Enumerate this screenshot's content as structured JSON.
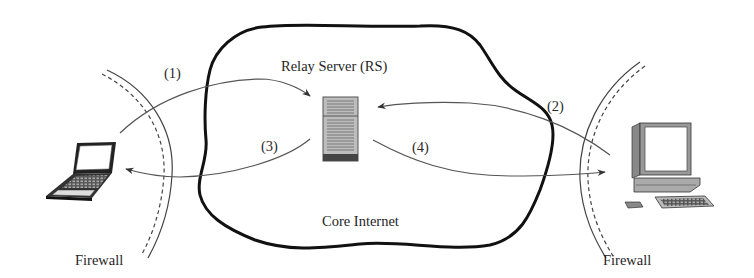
{
  "diagram": {
    "nodes": {
      "relay_server": {
        "label": "Relay Server (RS)",
        "icon": "server-tower-icon"
      },
      "core_internet": {
        "label": "Core Internet",
        "icon": "cloud-outline"
      },
      "left_client": {
        "icon": "laptop-icon"
      },
      "right_client": {
        "icon": "desktop-computer-icon"
      },
      "left_firewall": {
        "label": "Firewall"
      },
      "right_firewall": {
        "label": "Firewall"
      }
    },
    "steps": [
      {
        "id": 1,
        "label": "(1)",
        "from": "left_client",
        "to": "relay_server"
      },
      {
        "id": 2,
        "label": "(2)",
        "from": "right_client",
        "to": "relay_server"
      },
      {
        "id": 3,
        "label": "(3)",
        "from": "relay_server",
        "to": "left_client"
      },
      {
        "id": 4,
        "label": "(4)",
        "from": "relay_server",
        "to": "right_client"
      }
    ],
    "colors": {
      "cloud_stroke": "#111111",
      "arrow_stroke": "#555555",
      "firewall_stroke": "#444444",
      "server_fill": "#b8b8b8"
    }
  }
}
